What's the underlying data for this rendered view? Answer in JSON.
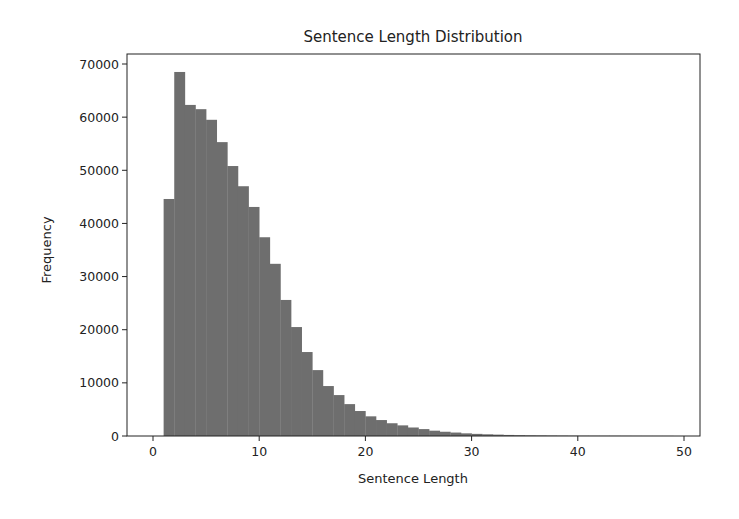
{
  "chart_data": {
    "type": "bar",
    "subtype": "histogram",
    "title": "Sentence Length Distribution",
    "xlabel": "Sentence Length",
    "ylabel": "Frequency",
    "xlim": [
      -2.5,
      51.5
    ],
    "ylim": [
      0,
      70000
    ],
    "xticks": [
      0,
      10,
      20,
      30,
      40,
      50
    ],
    "yticks": [
      0,
      10000,
      20000,
      30000,
      40000,
      50000,
      60000,
      70000
    ],
    "xtick_labels": [
      "0",
      "10",
      "20",
      "30",
      "40",
      "50"
    ],
    "ytick_labels": [
      "0",
      "10000",
      "20000",
      "30000",
      "40000",
      "50000",
      "60000",
      "70000"
    ],
    "grid": false,
    "legend": null,
    "bar_color": "#6e6e6e",
    "bin_width": 1,
    "bin_edges_start": 1,
    "categories": [
      "1",
      "2",
      "3",
      "4",
      "5",
      "6",
      "7",
      "8",
      "9",
      "10",
      "11",
      "12",
      "13",
      "14",
      "15",
      "16",
      "17",
      "18",
      "19",
      "20",
      "21",
      "22",
      "23",
      "24",
      "25",
      "26",
      "27",
      "28",
      "29",
      "30",
      "31",
      "32",
      "33",
      "34",
      "35",
      "36",
      "37",
      "38",
      "39",
      "40",
      "41",
      "42",
      "43",
      "44",
      "45",
      "46",
      "47",
      "48"
    ],
    "values": [
      44600,
      68500,
      62300,
      61500,
      59500,
      55300,
      50800,
      47000,
      43100,
      37400,
      32400,
      25600,
      20500,
      15800,
      12400,
      9400,
      7700,
      6000,
      4700,
      3700,
      3000,
      2400,
      2000,
      1600,
      1300,
      1000,
      800,
      650,
      500,
      400,
      320,
      260,
      200,
      160,
      130,
      110,
      90,
      75,
      60,
      50,
      45,
      40,
      35,
      30,
      25,
      20,
      18,
      15
    ]
  }
}
